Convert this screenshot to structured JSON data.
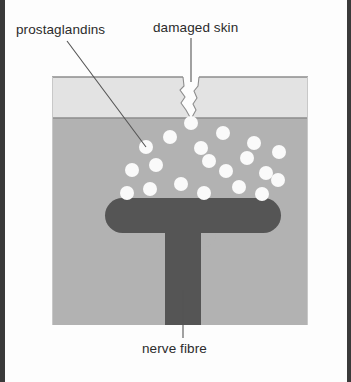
{
  "figure": {
    "title_visible": false,
    "background_color": "#ffffff",
    "edge_bar_color": "#3a3a3a"
  },
  "labels": {
    "prostaglandins": "prostaglandins",
    "damaged_skin": "damaged skin",
    "nerve_fibre": "nerve fibre"
  },
  "diagram": {
    "box": {
      "x": 47,
      "y": 76,
      "width": 256,
      "height": 249,
      "border_color": "#9a9a9a"
    },
    "layers": [
      {
        "name": "epidermis",
        "color": "#e3e3e3",
        "y": 76,
        "height": 42
      },
      {
        "name": "dermis",
        "color": "#b2b2b2",
        "y": 118,
        "height": 207
      }
    ],
    "wound": {
      "name": "damaged-skin-cut",
      "apex_x": 186,
      "top_y": 76,
      "bottom_y": 119,
      "color": "#e3e3e3"
    },
    "nerve_fibre": {
      "color": "#555555",
      "bar": {
        "x": 100,
        "y": 198,
        "width": 176,
        "height": 34,
        "radius": 17
      },
      "stem": {
        "x": 160,
        "y": 215,
        "width": 36,
        "height": 110
      }
    },
    "prostaglandin_dots": {
      "color": "#fafafa",
      "radius": 7,
      "positions": [
        [
          186,
          123
        ],
        [
          141,
          147
        ],
        [
          165,
          137
        ],
        [
          218,
          133
        ],
        [
          196,
          148
        ],
        [
          249,
          143
        ],
        [
          242,
          158
        ],
        [
          274,
          152
        ],
        [
          127,
          170
        ],
        [
          151,
          165
        ],
        [
          204,
          161
        ],
        [
          221,
          171
        ],
        [
          261,
          173
        ],
        [
          145,
          189
        ],
        [
          176,
          184
        ],
        [
          234,
          187
        ],
        [
          273,
          180
        ],
        [
          122,
          193
        ],
        [
          199,
          193
        ],
        [
          257,
          194
        ]
      ]
    },
    "leader_lines": [
      {
        "name": "prostaglandins-leader",
        "x1": 62,
        "y1": 41,
        "x2": 141,
        "y2": 147,
        "color": "#555555"
      },
      {
        "name": "damaged-skin-leader",
        "x1": 186,
        "y1": 38,
        "x2": 186,
        "y2": 82,
        "color": "#555555"
      },
      {
        "name": "nerve-fibre-leader",
        "x1": 178,
        "y1": 338,
        "x2": 178,
        "y2": 290,
        "color": "#555555"
      }
    ]
  }
}
